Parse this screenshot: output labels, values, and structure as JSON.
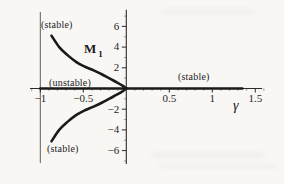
{
  "figure": {
    "background": "#f8f7f4",
    "ink": "#1a1a1a",
    "axis_color": "#2c2c2c"
  },
  "chart_data": {
    "type": "line",
    "title": "",
    "xlabel": "γ",
    "ylabel": "M",
    "ylabel_subscript": "1",
    "xlim": [
      -1.12,
      1.58
    ],
    "ylim": [
      -7.3,
      7.6
    ],
    "grid": false,
    "legend": "none",
    "guide_line_x": -1,
    "x_tick_values": [
      -1,
      -0.5,
      0.5,
      1,
      1.5
    ],
    "x_tick_labels": [
      "−1",
      "−0.5",
      "0.5",
      "1",
      "1.5"
    ],
    "x_minor_tick_step": 0.1,
    "y_tick_values": [
      -6,
      -4,
      -2,
      2,
      4,
      6
    ],
    "y_tick_labels": [
      "−6",
      "−4",
      "−2",
      "2",
      "4",
      "6"
    ],
    "y_minor_tick_values": [
      -7,
      -5,
      -3,
      -1,
      1,
      3,
      5,
      7
    ],
    "series": [
      {
        "name": "upper-nontrivial-branch",
        "stability": "stable",
        "label": "(stable)",
        "points": [
          [
            -0.87,
            5.1
          ],
          [
            -0.78,
            4.0
          ],
          [
            -0.68,
            3.2
          ],
          [
            -0.58,
            2.55
          ],
          [
            -0.48,
            2.1
          ],
          [
            -0.38,
            1.75
          ],
          [
            -0.28,
            1.35
          ],
          [
            -0.19,
            0.95
          ],
          [
            -0.11,
            0.6
          ],
          [
            -0.04,
            0.25
          ],
          [
            0,
            0
          ]
        ]
      },
      {
        "name": "lower-nontrivial-branch",
        "stability": "stable",
        "label": "(stable)",
        "points": [
          [
            -0.87,
            -5.1
          ],
          [
            -0.78,
            -4.0
          ],
          [
            -0.68,
            -3.2
          ],
          [
            -0.58,
            -2.55
          ],
          [
            -0.48,
            -2.1
          ],
          [
            -0.38,
            -1.75
          ],
          [
            -0.28,
            -1.35
          ],
          [
            -0.19,
            -0.95
          ],
          [
            -0.11,
            -0.6
          ],
          [
            -0.04,
            -0.25
          ],
          [
            0,
            0
          ]
        ]
      },
      {
        "name": "trivial-branch-negative-gamma",
        "stability": "unstable",
        "label": "(unstable)",
        "points": [
          [
            -1,
            0
          ],
          [
            0,
            0
          ]
        ]
      },
      {
        "name": "trivial-branch-positive-gamma",
        "stability": "stable",
        "label": "(stable)",
        "points": [
          [
            0,
            0
          ],
          [
            1.35,
            0
          ]
        ]
      }
    ]
  }
}
